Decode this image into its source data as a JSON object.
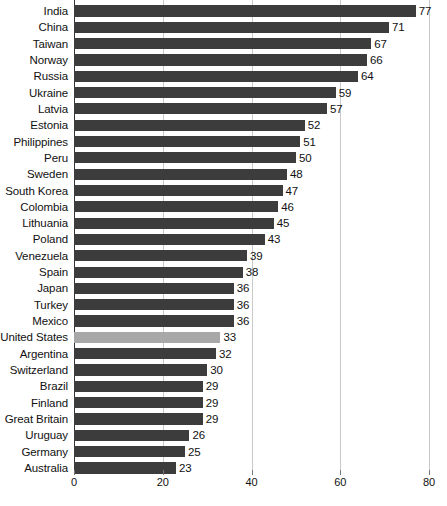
{
  "chart_data": {
    "type": "bar",
    "orientation": "horizontal",
    "title": "",
    "subtitle": "",
    "xlabel": "",
    "ylabel": "",
    "xlim": [
      0,
      80
    ],
    "xticks": [
      0,
      20,
      40,
      60,
      80
    ],
    "grid": true,
    "legend": false,
    "highlight_category": "United States",
    "colors": {
      "bar": "#3c3c3c",
      "highlight_bar": "#a8a8a8",
      "gridline": "#c9c9c9",
      "axis": "#333333",
      "text": "#111111",
      "background": "#ffffff"
    },
    "categories": [
      "India",
      "China",
      "Taiwan",
      "Norway",
      "Russia",
      "Ukraine",
      "Latvia",
      "Estonia",
      "Philippines",
      "Peru",
      "Sweden",
      "South Korea",
      "Colombia",
      "Lithuania",
      "Poland",
      "Venezuela",
      "Spain",
      "Japan",
      "Turkey",
      "Mexico",
      "United States",
      "Argentina",
      "Switzerland",
      "Brazil",
      "Finland",
      "Great Britain",
      "Uruguay",
      "Germany",
      "Australia"
    ],
    "values": [
      77,
      71,
      67,
      66,
      64,
      59,
      57,
      52,
      51,
      50,
      48,
      47,
      46,
      45,
      43,
      39,
      38,
      36,
      36,
      36,
      33,
      32,
      30,
      29,
      29,
      29,
      26,
      25,
      23
    ]
  }
}
